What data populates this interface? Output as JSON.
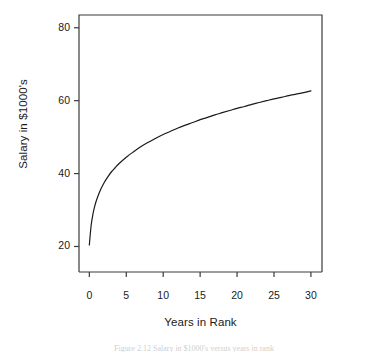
{
  "figure": {
    "background_color": "#ffffff",
    "foreground_color": "#1a1a1a",
    "caption_partial": "Figure  2.12   Salary in $1000's versus years in rank"
  },
  "chart_data": {
    "type": "line",
    "title": "",
    "subtitle": "",
    "xlabel": "Years in Rank",
    "ylabel": "Salary in $1000's",
    "xlim": [
      -1.4,
      31.5
    ],
    "ylim": [
      13.0,
      83.5
    ],
    "xticks": [
      0,
      5,
      10,
      15,
      20,
      25,
      30
    ],
    "xticklabels": [
      "0",
      "5",
      "10",
      "15",
      "20",
      "25",
      "30"
    ],
    "yticks": [
      20,
      40,
      60,
      80
    ],
    "yticklabels": [
      "20",
      "40",
      "60",
      "80"
    ],
    "grid": false,
    "legend": null,
    "legend_position": "none",
    "annotations": [],
    "series": [
      {
        "name": "Salary",
        "color": "#1a1a1a",
        "line_width": 1.2,
        "marker": "none",
        "x": [
          0,
          0.25,
          0.5,
          0.75,
          1,
          1.5,
          2,
          2.5,
          3,
          3.5,
          4,
          5,
          6,
          7,
          8,
          9,
          10,
          11,
          12,
          13,
          14,
          15,
          16,
          17,
          18,
          19,
          20,
          21,
          22,
          23,
          24,
          25,
          26,
          27,
          28,
          29,
          30
        ],
        "y": [
          20.4,
          25.9,
          29.0,
          31.2,
          32.9,
          35.5,
          37.5,
          39.1,
          40.5,
          41.6,
          42.7,
          44.5,
          46.0,
          47.4,
          48.6,
          49.7,
          50.7,
          51.6,
          52.5,
          53.3,
          54.0,
          54.8,
          55.4,
          56.1,
          56.7,
          57.3,
          57.9,
          58.4,
          59.0,
          59.5,
          60.0,
          60.5,
          60.9,
          61.4,
          61.8,
          62.2,
          62.7
        ]
      }
    ]
  },
  "plot_box": {
    "left": 79,
    "top": 15,
    "right": 322,
    "bottom": 272
  }
}
